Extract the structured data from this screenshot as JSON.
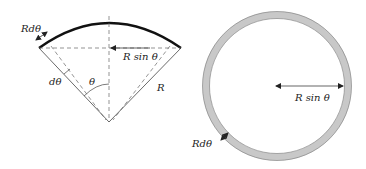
{
  "diagram": {
    "left_figure": {
      "description": "Circular sector of radius R with arc element",
      "labels": {
        "arc_element": "Rdθ",
        "horizontal_radius": "R sin θ",
        "angle_element": "dθ",
        "angle": "θ",
        "radius": "R"
      }
    },
    "right_figure": {
      "description": "Ring (annulus) of radius R sin θ and width R dθ",
      "labels": {
        "ring_radius": "R sin θ",
        "ring_width": "Rdθ"
      }
    },
    "colors": {
      "ring_fill": "#c8c8c8",
      "line": "#333333",
      "arc": "#111111"
    }
  }
}
